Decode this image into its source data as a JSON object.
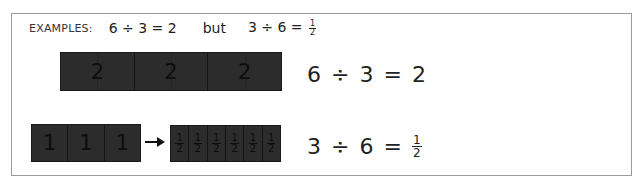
{
  "header": {
    "label": "EXAMPLES:",
    "example1": "6 ÷ 3 = 2",
    "connector": "but",
    "example2_prefix": "3 ÷ 6 =",
    "example2_fraction": {
      "numerator": "1",
      "denominator": "2"
    }
  },
  "diagram1": {
    "bar_segments": [
      "2",
      "2",
      "2"
    ],
    "equation": {
      "left": "6",
      "operator": "÷",
      "right": "3",
      "equals": "=",
      "result": "2"
    }
  },
  "diagram2": {
    "source_segments": [
      "1",
      "1",
      "1"
    ],
    "arrow": "right-arrow",
    "target_segments": [
      {
        "numerator": "1",
        "denominator": "2"
      },
      {
        "numerator": "1",
        "denominator": "2"
      },
      {
        "numerator": "1",
        "denominator": "2"
      },
      {
        "numerator": "1",
        "denominator": "2"
      },
      {
        "numerator": "1",
        "denominator": "2"
      },
      {
        "numerator": "1",
        "denominator": "2"
      }
    ],
    "equation": {
      "left": "3",
      "operator": "÷",
      "right": "6",
      "equals": "=",
      "result": {
        "numerator": "1",
        "denominator": "2"
      }
    }
  },
  "colors": {
    "bar_fill": "#2c2c2c",
    "frame_border": "#9a9a9a",
    "text": "#222222"
  }
}
